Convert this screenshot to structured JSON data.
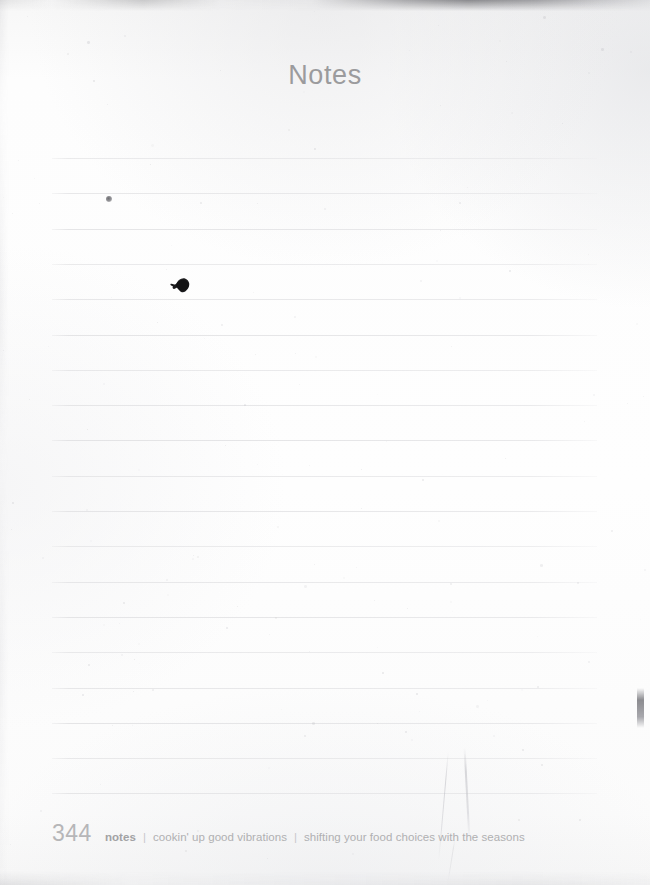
{
  "page": {
    "kind": "scanned-book-page",
    "width": 650,
    "height": 885,
    "background_color": "#fdfdfc"
  },
  "header": {
    "title": "Notes",
    "title_color": "#9b9b9d"
  },
  "notes_area": {
    "line_count": 19,
    "first_line_y": 158,
    "line_spacing": 35.3,
    "line_left": 52,
    "line_right": 597,
    "line_color": "#e4e4e6"
  },
  "footer": {
    "page_number": "344",
    "page_number_color": "#b6b6b8",
    "section": "notes",
    "separator": "|",
    "breadcrumb": [
      "cookin' up good vibrations",
      "shifting your food choices with the seasons"
    ],
    "text_color": "#b0b0b2"
  },
  "artifacts": {
    "ink_dot": "small-ink-dot",
    "ink_blot": "ink-blot-smudge",
    "top_edge": "dark-scan-edge",
    "right_edge": "dark-vertical-smudge",
    "creases": "faint-fold-lines"
  }
}
